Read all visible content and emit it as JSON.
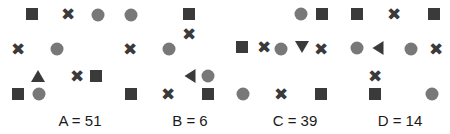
{
  "image": {
    "width": 450,
    "height": 134,
    "background": "#ffffff",
    "kind": "shape-counting-puzzle"
  },
  "palette": {
    "dark": "#3a3a3a",
    "gray": "#787878",
    "label_text": "#1a1a1a"
  },
  "labels": [
    {
      "id": "A",
      "text": "A = 51",
      "letter": "A",
      "value": 51,
      "x": 80,
      "y": 112
    },
    {
      "id": "B",
      "text": "B = 6",
      "letter": "B",
      "value": 6,
      "x": 190,
      "y": 112
    },
    {
      "id": "C",
      "text": "C = 39",
      "letter": "C",
      "value": 39,
      "x": 295,
      "y": 112
    },
    {
      "id": "D",
      "text": "D = 14",
      "letter": "D",
      "value": 14,
      "x": 400,
      "y": 112
    }
  ],
  "shape_legend": {
    "square": "dark-square",
    "circle": "gray-circle",
    "cross": "dark-x-cross",
    "triangle_up": "dark-triangle-up",
    "triangle_down": "dark-triangle-down",
    "triangle_left": "dark-triangle-left"
  },
  "counts": {
    "square": 16,
    "circle": 13,
    "cross": 14,
    "triangle_up": 1,
    "triangle_down": 1,
    "triangle_left": 2,
    "total": 47
  },
  "shapes": [
    {
      "type": "square",
      "x": 32,
      "y": 14
    },
    {
      "type": "cross",
      "x": 68,
      "y": 14
    },
    {
      "type": "circle",
      "x": 98,
      "y": 15
    },
    {
      "type": "circle",
      "x": 131,
      "y": 15
    },
    {
      "type": "square",
      "x": 189,
      "y": 14
    },
    {
      "type": "circle",
      "x": 301,
      "y": 14
    },
    {
      "type": "square",
      "x": 322,
      "y": 14
    },
    {
      "type": "square",
      "x": 357,
      "y": 14
    },
    {
      "type": "cross",
      "x": 394,
      "y": 14
    },
    {
      "type": "square",
      "x": 434,
      "y": 14
    },
    {
      "type": "cross",
      "x": 189,
      "y": 34
    },
    {
      "type": "cross",
      "x": 18,
      "y": 49
    },
    {
      "type": "circle",
      "x": 57,
      "y": 49
    },
    {
      "type": "cross",
      "x": 130,
      "y": 49
    },
    {
      "type": "circle",
      "x": 169,
      "y": 49
    },
    {
      "type": "square",
      "x": 242,
      "y": 47
    },
    {
      "type": "cross",
      "x": 264,
      "y": 47
    },
    {
      "type": "triangle_down",
      "x": 302,
      "y": 47
    },
    {
      "type": "circle",
      "x": 357,
      "y": 48
    },
    {
      "type": "triangle_left",
      "x": 378,
      "y": 48
    },
    {
      "type": "circle",
      "x": 411,
      "y": 49
    },
    {
      "type": "cross",
      "x": 436,
      "y": 49
    },
    {
      "type": "triangle_up",
      "x": 38,
      "y": 76
    },
    {
      "type": "cross",
      "x": 77,
      "y": 76
    },
    {
      "type": "square",
      "x": 96,
      "y": 76
    },
    {
      "type": "triangle_left",
      "x": 190,
      "y": 76
    },
    {
      "type": "circle",
      "x": 208,
      "y": 76
    },
    {
      "type": "cross",
      "x": 375,
      "y": 76
    },
    {
      "type": "square",
      "x": 18,
      "y": 94
    },
    {
      "type": "circle",
      "x": 39,
      "y": 94
    },
    {
      "type": "square",
      "x": 131,
      "y": 94
    },
    {
      "type": "cross",
      "x": 168,
      "y": 94
    },
    {
      "type": "square",
      "x": 208,
      "y": 94
    },
    {
      "type": "circle",
      "x": 243,
      "y": 94
    },
    {
      "type": "cross",
      "x": 281,
      "y": 94
    },
    {
      "type": "square",
      "x": 321,
      "y": 94
    },
    {
      "type": "square",
      "x": 375,
      "y": 94
    },
    {
      "type": "circle",
      "x": 432,
      "y": 94
    },
    {
      "type": "circle",
      "x": 281,
      "y": 49
    },
    {
      "type": "cross",
      "x": 321,
      "y": 49
    }
  ],
  "cross_glyph": "✖"
}
